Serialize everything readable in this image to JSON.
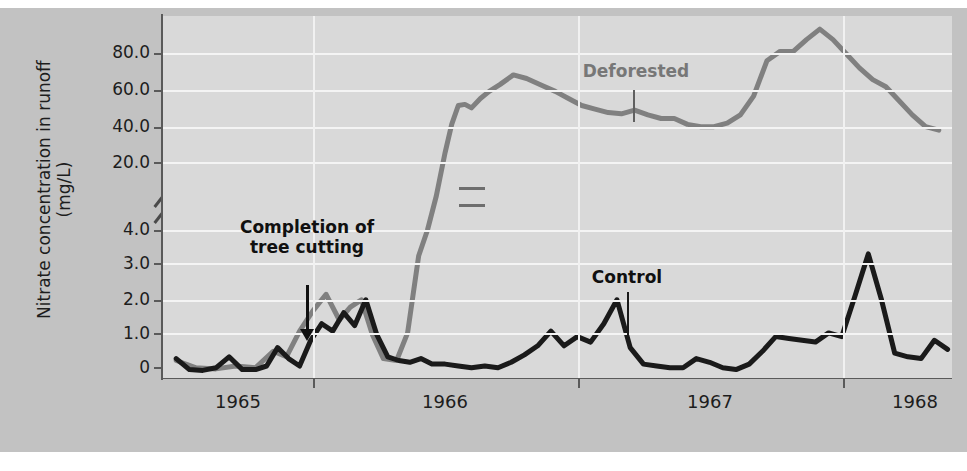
{
  "figure": {
    "background_outer": "#c2c2c2",
    "background_plot": "#d9d9d9",
    "gridline_color": "#f4f4f4",
    "axis_color": "#5a5a5a"
  },
  "axes": {
    "y_title_line1": "Nitrate concentration in runoff",
    "y_title_line2": "(mg/L)",
    "y_ticks": [
      "80.0",
      "60.0",
      "40.0",
      "20.0",
      "4.0",
      "3.0",
      "2.0",
      "1.0",
      "0"
    ],
    "x_ticks": [
      "1965",
      "1966",
      "1967",
      "1968"
    ],
    "axis_break": true
  },
  "annotations": {
    "tree_cutting_line1": "Completion of",
    "tree_cutting_line2": "tree cutting",
    "deforested": "Deforested",
    "control": "Control"
  },
  "series_colors": {
    "deforested": "#808080",
    "control": "#1a1a1a"
  },
  "chart_data": {
    "type": "line",
    "title": "",
    "xlabel": "",
    "ylabel": "Nitrate concentration in runoff (mg/L)",
    "xlim": [
      1964.72,
      1968.3
    ],
    "ylim_lower_segment": [
      0,
      4.0
    ],
    "ylim_upper_segment": [
      20.0,
      88.0
    ],
    "axis_break_between": [
      4.0,
      20.0
    ],
    "grid": true,
    "legend": "inline-labels",
    "xtick_values": [
      1965,
      1966,
      1967,
      1968
    ],
    "ytick_values": [
      0,
      1.0,
      2.0,
      3.0,
      4.0,
      20.0,
      40.0,
      60.0,
      80.0
    ],
    "annotations": [
      {
        "text": "Completion of tree cutting",
        "x": 1965.22,
        "y": 0.95,
        "type": "arrow"
      },
      {
        "text": "Deforested",
        "x": 1966.44,
        "y": 52.0,
        "type": "label"
      },
      {
        "text": "Control",
        "x": 1966.43,
        "y": 2.6,
        "type": "label"
      }
    ],
    "series": [
      {
        "name": "Deforested",
        "color": "#808080",
        "x": [
          1964.78,
          1964.87,
          1964.96,
          1965.05,
          1965.14,
          1965.22,
          1965.28,
          1965.34,
          1965.4,
          1965.46,
          1965.52,
          1965.57,
          1965.62,
          1965.67,
          1965.72,
          1965.78,
          1965.83,
          1965.88,
          1965.92,
          1965.96,
          1966.0,
          1966.03,
          1966.06,
          1966.09,
          1966.12,
          1966.16,
          1966.2,
          1966.25,
          1966.31,
          1966.37,
          1966.44,
          1966.5,
          1966.56,
          1966.62,
          1966.68,
          1966.74,
          1966.8,
          1966.86,
          1966.92,
          1966.98,
          1967.04,
          1967.1,
          1967.16,
          1967.22,
          1967.28,
          1967.34,
          1967.4,
          1967.46,
          1967.52,
          1967.58,
          1967.64,
          1967.7,
          1967.76,
          1967.82,
          1967.88,
          1967.94,
          1968.0,
          1968.06,
          1968.12,
          1968.18,
          1968.24
        ],
        "y": [
          0.45,
          0.25,
          0.22,
          0.3,
          0.25,
          0.7,
          0.55,
          1.25,
          1.8,
          2.25,
          1.55,
          1.9,
          2.1,
          1.15,
          0.5,
          0.45,
          1.2,
          3.3,
          4.0,
          12.0,
          24.0,
          36.0,
          44.0,
          44.5,
          43.0,
          47.0,
          50.0,
          53.0,
          57.0,
          55.5,
          52.5,
          50.0,
          47.0,
          44.0,
          42.5,
          41.0,
          40.5,
          42.0,
          40.0,
          38.5,
          38.5,
          36.0,
          35.0,
          35.0,
          36.5,
          40.0,
          48.0,
          63.0,
          67.0,
          67.0,
          72.0,
          76.5,
          72.0,
          66.0,
          60.0,
          55.0,
          52.0,
          46.0,
          40.0,
          35.0,
          33.5
        ],
        "note": "values between 4.0 and 20.0 are drawn across the axis break"
      },
      {
        "name": "Control",
        "color": "#1a1a1a",
        "x": [
          1964.78,
          1964.84,
          1964.9,
          1964.96,
          1965.02,
          1965.08,
          1965.14,
          1965.19,
          1965.24,
          1965.29,
          1965.34,
          1965.39,
          1965.44,
          1965.49,
          1965.54,
          1965.59,
          1965.64,
          1965.69,
          1965.74,
          1965.79,
          1965.84,
          1965.89,
          1965.94,
          1966.0,
          1966.06,
          1966.12,
          1966.18,
          1966.24,
          1966.3,
          1966.36,
          1966.42,
          1966.48,
          1966.54,
          1966.6,
          1966.66,
          1966.72,
          1966.78,
          1966.84,
          1966.9,
          1966.96,
          1967.02,
          1967.08,
          1967.14,
          1967.2,
          1967.26,
          1967.32,
          1967.38,
          1967.44,
          1967.5,
          1967.56,
          1967.62,
          1967.68,
          1967.74,
          1967.8,
          1967.86,
          1967.92,
          1967.98,
          1968.04,
          1968.1,
          1968.16,
          1968.22,
          1968.28
        ],
        "y": [
          0.5,
          0.2,
          0.18,
          0.25,
          0.55,
          0.2,
          0.2,
          0.3,
          0.8,
          0.5,
          0.3,
          1.0,
          1.45,
          1.25,
          1.75,
          1.4,
          2.1,
          1.15,
          0.55,
          0.45,
          0.4,
          0.5,
          0.35,
          0.35,
          0.3,
          0.25,
          0.3,
          0.25,
          0.4,
          0.6,
          0.85,
          1.25,
          0.85,
          1.1,
          0.95,
          1.45,
          2.1,
          0.8,
          0.35,
          0.3,
          0.25,
          0.25,
          0.5,
          0.4,
          0.25,
          0.2,
          0.35,
          0.7,
          1.1,
          1.05,
          1.0,
          0.95,
          1.2,
          1.1,
          2.2,
          3.35,
          2.1,
          0.65,
          0.55,
          0.5,
          1.0,
          0.75
        ]
      }
    ]
  }
}
